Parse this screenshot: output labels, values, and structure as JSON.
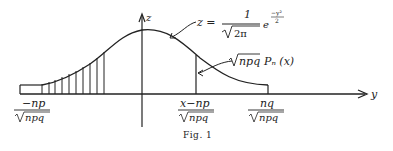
{
  "figure": {
    "caption": "Fig. 1",
    "axes": {
      "vertical_label": "z",
      "horizontal_label": "y"
    },
    "curve_formula": {
      "lhs": "z =",
      "numerator": "1",
      "denominator_radicand": "2π",
      "exp_base": "e",
      "exponent_numerator": "−y²",
      "exponent_denominator": "2"
    },
    "step_label": {
      "radical": "npq",
      "rest": "Pₙ (x)"
    },
    "tick_labels": [
      {
        "numerator": "−np",
        "denominator": "npq"
      },
      {
        "numerator": "x−np",
        "denominator": "npq"
      },
      {
        "numerator": "nq",
        "denominator": "npq"
      }
    ],
    "colors": {
      "ink": "#222222",
      "background": "#ffffff"
    }
  }
}
